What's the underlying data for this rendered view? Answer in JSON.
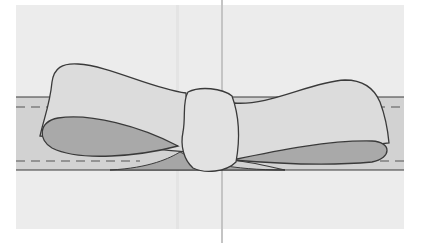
{
  "illustration": {
    "subject": "ribbon bow tied on a band",
    "colors": {
      "page": "#ffffff",
      "panel": "#ececec",
      "fold_line": "#c4c4c4",
      "band": "#d2d2d2",
      "loop_top": "#dcdcdc",
      "loop_underside": "#a9a9a9",
      "knot": "#e2e2e2",
      "tail_shadow": "#9e9e9e",
      "outline": "#3a3a3a",
      "stitch": "#555555"
    }
  }
}
